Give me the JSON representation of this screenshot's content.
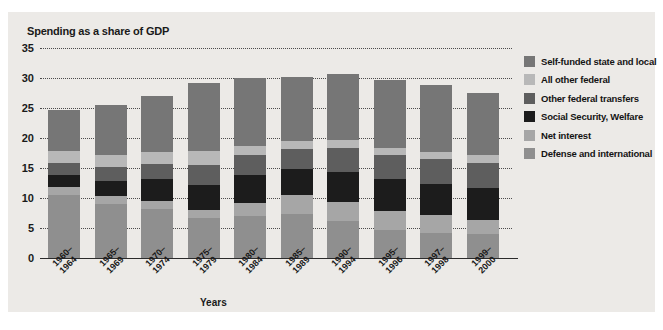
{
  "chart_data": {
    "type": "bar",
    "stacked": true,
    "title": "Spending as a share of GDP",
    "xlabel": "Years",
    "ylabel": "",
    "ylim": [
      0,
      35
    ],
    "yticks": [
      0,
      5,
      10,
      15,
      20,
      25,
      30,
      35
    ],
    "grid": true,
    "legend_position": "right",
    "categories": [
      "1960–\n1964",
      "1965–\n1969",
      "1970–\n1974",
      "1975–\n1979",
      "1980–\n1984",
      "1985–\n1989",
      "1990–\n1994",
      "1995–\n1996",
      "1997–\n1998",
      "1999–\n2000"
    ],
    "category_lines": [
      [
        "1960–",
        "1964"
      ],
      [
        "1965–",
        "1969"
      ],
      [
        "1970–",
        "1974"
      ],
      [
        "1975–",
        "1979"
      ],
      [
        "1980–",
        "1984"
      ],
      [
        "1985–",
        "1989"
      ],
      [
        "1990–",
        "1994"
      ],
      [
        "1995–",
        "1996"
      ],
      [
        "1997–",
        "1998"
      ],
      [
        "1999–",
        "2000"
      ]
    ],
    "series": [
      {
        "name": "Defense and international",
        "color": "#8f8f8f",
        "values": [
          10.5,
          9.0,
          8.2,
          6.6,
          7.0,
          7.4,
          6.1,
          4.6,
          4.2,
          4.0
        ]
      },
      {
        "name": "Net interest",
        "color": "#a6a6a6",
        "values": [
          1.3,
          1.3,
          1.3,
          1.4,
          2.2,
          3.1,
          3.2,
          3.2,
          2.9,
          2.4
        ]
      },
      {
        "name": "Social Security, Welfare",
        "color": "#1c1c1c",
        "values": [
          2.0,
          2.6,
          3.6,
          4.2,
          4.6,
          4.4,
          5.0,
          5.4,
          5.3,
          5.3
        ]
      },
      {
        "name": "Other federal transfers",
        "color": "#5e5e5e",
        "values": [
          2.0,
          2.2,
          2.5,
          3.3,
          3.3,
          3.2,
          4.0,
          4.0,
          4.1,
          4.2
        ]
      },
      {
        "name": "All other federal",
        "color": "#b8b8b8",
        "values": [
          2.0,
          2.1,
          2.1,
          2.3,
          1.6,
          1.4,
          1.4,
          1.2,
          1.2,
          1.2
        ]
      },
      {
        "name": "Self-funded state and local",
        "color": "#767676",
        "values": [
          6.9,
          8.3,
          9.3,
          11.4,
          11.3,
          10.6,
          10.9,
          11.2,
          11.2,
          10.4
        ]
      }
    ],
    "totals": [
      24.7,
      25.5,
      27.0,
      29.2,
      30.0,
      30.1,
      30.6,
      29.6,
      28.9,
      27.5
    ]
  },
  "legend": {
    "items": [
      {
        "label": "Self-funded state and local",
        "color": "#767676"
      },
      {
        "label": "All other federal",
        "color": "#b8b8b8"
      },
      {
        "label": "Other federal transfers",
        "color": "#5e5e5e"
      },
      {
        "label": "Social Security, Welfare",
        "color": "#1c1c1c"
      },
      {
        "label": "Net interest",
        "color": "#a6a6a6"
      },
      {
        "label": "Defense and international",
        "color": "#8f8f8f"
      }
    ]
  }
}
